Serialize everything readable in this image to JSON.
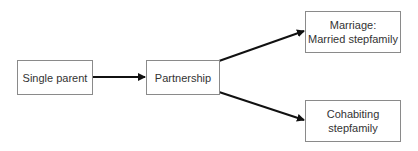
{
  "diagram": {
    "nodes": [
      {
        "id": "single-parent",
        "label": "Single parent"
      },
      {
        "id": "partnership",
        "label": "Partnership"
      },
      {
        "id": "married-stepfamily",
        "label_line1": "Marriage:",
        "label_line2": "Married stepfamily"
      },
      {
        "id": "cohabiting-stepfamily",
        "label_line1": "Cohabiting",
        "label_line2": "stepfamily"
      }
    ],
    "edges": [
      {
        "from": "single-parent",
        "to": "partnership"
      },
      {
        "from": "partnership",
        "to": "married-stepfamily"
      },
      {
        "from": "partnership",
        "to": "cohabiting-stepfamily"
      }
    ],
    "colors": {
      "box_border": "#8a8a8a",
      "arrow": "#111111",
      "text": "#333333"
    }
  }
}
